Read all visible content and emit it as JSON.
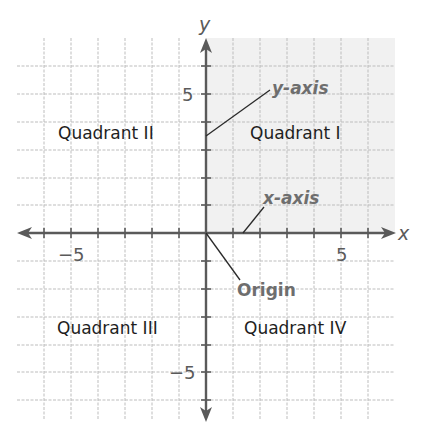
{
  "diagram": {
    "type": "coordinate-plane",
    "axes": {
      "x_label": "x",
      "y_label": "y",
      "x_ticks": {
        "neg": "−5",
        "pos": "5"
      },
      "y_ticks": {
        "pos": "5",
        "neg": "−5"
      },
      "x_range": [
        -7,
        7
      ],
      "y_range": [
        -7,
        7
      ]
    },
    "quadrants": {
      "q1": "Quadrant I",
      "q2": "Quadrant II",
      "q3": "Quadrant III",
      "q4": "Quadrant IV"
    },
    "callouts": {
      "y_axis": "y-axis",
      "x_axis": "x-axis",
      "origin": "Origin"
    },
    "shaded_quadrant": "Quadrant I",
    "colors": {
      "axis": "#5a5a5a",
      "grid": "#bdbdbd",
      "shade": "#f1f1f1",
      "callout_text": "#6e6e6e",
      "label_text": "#1e1e1e"
    }
  }
}
